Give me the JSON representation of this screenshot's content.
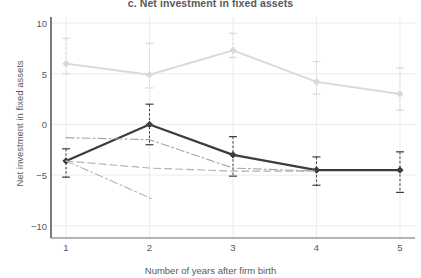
{
  "chart_data": {
    "type": "line",
    "title": "c. Net investment in fixed assets",
    "xlabel": "Number of years after firm birth",
    "ylabel": "Net investment in fixed assets",
    "x": [
      1,
      2,
      3,
      4,
      5
    ],
    "xticklabels": [
      "1",
      "2",
      "3",
      "4",
      "5"
    ],
    "yticklabels": [
      "10",
      "5",
      "0",
      "−5",
      "−10"
    ],
    "yticks": [
      10,
      5,
      0,
      -5,
      -10
    ],
    "xlim": [
      0.82,
      5.18
    ],
    "ylim": [
      -11.2,
      10.6
    ],
    "grid": true,
    "legend": "none",
    "errorbars": true,
    "series": [
      {
        "name": "upper-light-series",
        "color": "#d9d9d9",
        "style": "solid",
        "markers": true,
        "values": [
          6.0,
          4.9,
          7.3,
          4.2,
          3.0
        ],
        "ci_low": [
          5.0,
          3.6,
          6.6,
          3.0,
          1.4
        ],
        "ci_high": [
          8.5,
          8.0,
          9.0,
          6.2,
          5.6
        ]
      },
      {
        "name": "main-dark-series",
        "color": "#3d3d3d",
        "style": "solid",
        "markers": true,
        "values": [
          -3.6,
          0.0,
          -3.0,
          -4.5,
          -4.5
        ],
        "ci_low": [
          -5.2,
          -2.0,
          -5.1,
          -6.0,
          -6.7
        ],
        "ci_high": [
          -2.4,
          2.0,
          -1.2,
          -3.2,
          -2.7
        ]
      },
      {
        "name": "dashdot-series-a",
        "color": "#a6a6a6",
        "style": "dashdot",
        "markers": false,
        "x": [
          1,
          2,
          3,
          4
        ],
        "values": [
          -1.3,
          -1.5,
          -4.3,
          -4.6
        ]
      },
      {
        "name": "dashed-series-b",
        "color": "#b0b0b0",
        "style": "dashed",
        "markers": false,
        "x": [
          1,
          2,
          3,
          4
        ],
        "values": [
          -3.6,
          -4.3,
          -4.6,
          -4.6
        ]
      },
      {
        "name": "dashdot-series-c",
        "color": "#b5b5b5",
        "style": "dashdot",
        "markers": false,
        "x": [
          1,
          2.02
        ],
        "values": [
          -3.6,
          -7.3
        ]
      }
    ]
  },
  "axes": {
    "spine_color": "#6d6d6d",
    "grid_color": "#ececec"
  }
}
